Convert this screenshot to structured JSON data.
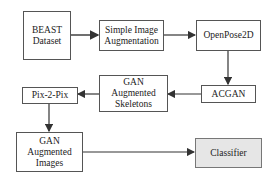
{
  "diagram": {
    "type": "flowchart",
    "nodes": [
      {
        "id": "beast",
        "label": "BEAST Dataset"
      },
      {
        "id": "simple_aug",
        "label": "Simple Image Augmentation"
      },
      {
        "id": "openpose",
        "label": "OpenPose2D"
      },
      {
        "id": "acgan",
        "label": "ACGAN"
      },
      {
        "id": "gan_skeletons",
        "label": "GAN Augmented Skeletons"
      },
      {
        "id": "pix2pix",
        "label": "Pix-2-Pix"
      },
      {
        "id": "gan_images",
        "label": "GAN Augmented Images"
      },
      {
        "id": "classifier",
        "label": "Classifier"
      }
    ],
    "edges": [
      {
        "from": "beast",
        "to": "simple_aug"
      },
      {
        "from": "simple_aug",
        "to": "openpose"
      },
      {
        "from": "openpose",
        "to": "acgan"
      },
      {
        "from": "acgan",
        "to": "gan_skeletons"
      },
      {
        "from": "gan_skeletons",
        "to": "pix2pix"
      },
      {
        "from": "pix2pix",
        "to": "gan_images"
      },
      {
        "from": "gan_images",
        "to": "classifier"
      }
    ],
    "colors": {
      "border": "#555555",
      "classifier_fill": "#e6e6e6",
      "arrow": "#333333"
    }
  }
}
